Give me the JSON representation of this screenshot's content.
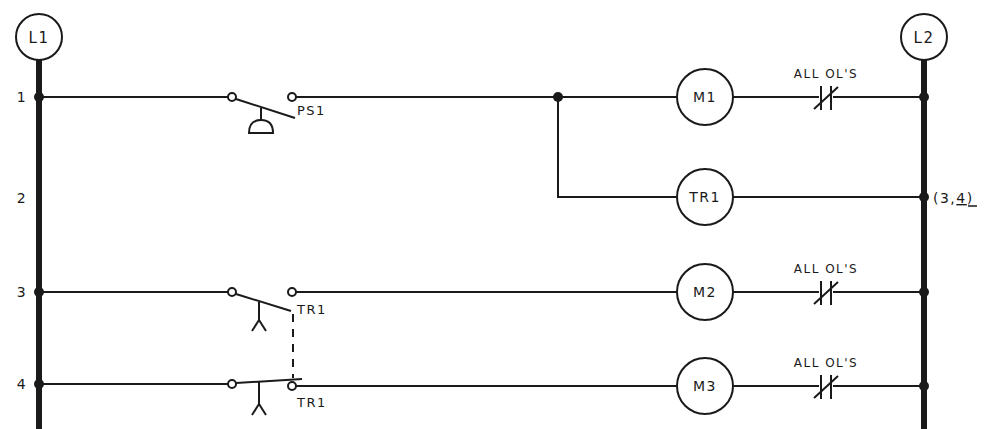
{
  "diagram": {
    "type": "ladder-logic-schematic",
    "rails": {
      "left": {
        "label": "L1"
      },
      "right": {
        "label": "L2"
      }
    },
    "rung_numbers": [
      "1",
      "2",
      "3",
      "4"
    ],
    "rungs": [
      {
        "number": "1",
        "contact": {
          "label": "PS1",
          "type": "normally-open pushbutton"
        },
        "coil": {
          "label": "M1"
        },
        "overload": {
          "label": "ALL OL'S"
        }
      },
      {
        "number": "2",
        "contact": null,
        "coil": {
          "label": "TR1"
        },
        "cross_reference": "(3,4)",
        "cross_reference_parts": {
          "open": "(3,",
          "underlined": "4",
          "close": ")"
        }
      },
      {
        "number": "3",
        "contact": {
          "label": "TR1",
          "type": "normally-open timed-closed"
        },
        "coil": {
          "label": "M2"
        },
        "overload": {
          "label": "ALL OL'S"
        }
      },
      {
        "number": "4",
        "contact": {
          "label": "TR1",
          "type": "normally-closed timed-open"
        },
        "coil": {
          "label": "M3"
        },
        "overload": {
          "label": "ALL OL'S"
        }
      }
    ],
    "colors": {
      "ink": "#1a1a1a",
      "background": "#ffffff"
    }
  }
}
